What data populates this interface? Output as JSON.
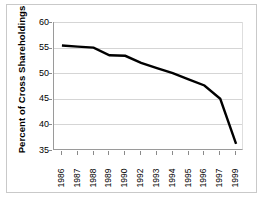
{
  "chart_data": {
    "type": "line",
    "title": "",
    "xlabel": "",
    "ylabel": "Percent of Cross Shareholdings",
    "ylim": [
      35,
      60
    ],
    "ytick_labels": [
      "60",
      "55",
      "50",
      "45",
      "40",
      "35"
    ],
    "ytick_values": [
      60,
      55,
      50,
      45,
      40,
      35
    ],
    "categories": [
      "1986",
      "1987",
      "1988",
      "1989",
      "1990",
      "1992",
      "1993",
      "1994",
      "1995",
      "1996",
      "1997",
      "1999"
    ],
    "values": [
      55.4,
      55.2,
      55.0,
      53.5,
      53.4,
      52.0,
      51.0,
      50.0,
      48.8,
      47.6,
      45.0,
      36.2
    ],
    "series": [
      {
        "name": "Percent of Cross Shareholdings",
        "values": [
          55.4,
          55.2,
          55.0,
          53.5,
          53.4,
          52.0,
          51.0,
          50.0,
          48.8,
          47.6,
          45.0,
          36.2
        ]
      }
    ],
    "grid": "horizontal",
    "legend": "none",
    "line_color": "#000000",
    "gridline_color": "#d5d5d5",
    "axis_color": "#9a9a9a",
    "background_color": "#ffffff"
  }
}
